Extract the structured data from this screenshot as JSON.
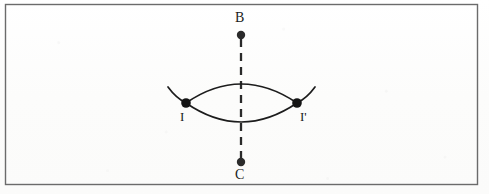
{
  "figure": {
    "background_color": "#fdfdfc",
    "ink_color": "#1c1c1c",
    "frame": {
      "name": "outer-rectangle-border",
      "x": 5,
      "y": 4,
      "width": 473,
      "height": 181,
      "stroke_color": "#6b6b6b",
      "stroke_width": 1.4
    },
    "axis": {
      "name": "vertical-dashed-axis",
      "x": 241,
      "y_top": 39,
      "y_bottom": 159,
      "style": "dashed",
      "dash_length": 8,
      "dash_gap": 6,
      "stroke_color": "#2a2a2a",
      "stroke_width": 2.2
    },
    "points": [
      {
        "id": "B",
        "label": "B",
        "x": 241,
        "y": 35,
        "radius": 4.2,
        "label_position": "above"
      },
      {
        "id": "C",
        "label": "C",
        "x": 241,
        "y": 162,
        "radius": 4.2,
        "label_position": "below"
      },
      {
        "id": "I",
        "label": "I",
        "x": 186,
        "y": 103,
        "radius": 4.6,
        "label_position": "below-left"
      },
      {
        "id": "Ip",
        "label": "I'",
        "x": 297,
        "y": 103,
        "radius": 4.6,
        "label_position": "below-right"
      }
    ],
    "arcs": [
      {
        "name": "upper-arc",
        "from": "I",
        "to": "Ip",
        "apex_x": 241,
        "apex_y": 84,
        "curvature": "bulges-upward"
      },
      {
        "name": "lower-arc",
        "from": "I",
        "to": "Ip",
        "apex_x": 241,
        "apex_y": 122,
        "curvature": "bulges-downward"
      }
    ],
    "arc_tails": [
      {
        "name": "left-arc-tail",
        "from_x": 186,
        "from_y": 103,
        "to_x": 168,
        "to_y": 87,
        "direction": "up-left"
      },
      {
        "name": "right-arc-tail",
        "from_x": 297,
        "from_y": 103,
        "to_x": 315,
        "to_y": 87,
        "direction": "up-right"
      }
    ],
    "labels": {
      "b": "B",
      "c": "C",
      "i": "I",
      "i_prime": "I'"
    }
  }
}
